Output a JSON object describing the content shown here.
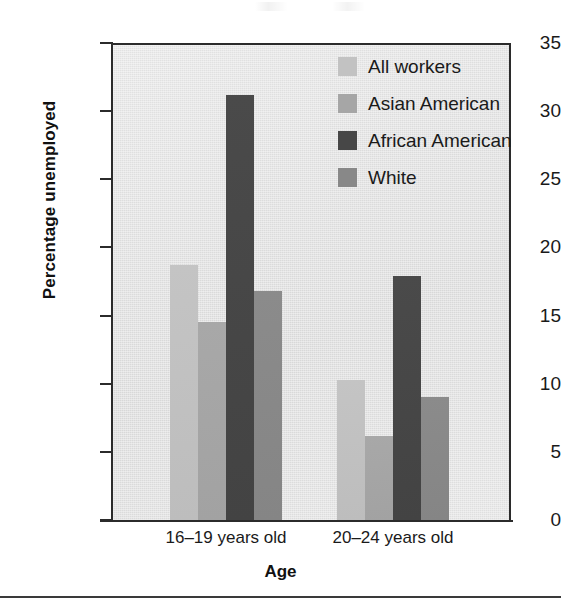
{
  "chart_data": {
    "type": "bar",
    "title": "",
    "xlabel": "Age",
    "ylabel": "Percentage unemployed",
    "categories": [
      "16–19 years old",
      "20–24 years old"
    ],
    "series": [
      {
        "name": "All workers",
        "color": "#c2c2c2",
        "values": [
          18.7,
          10.3
        ]
      },
      {
        "name": "Asian American",
        "color": "#a6a6a6",
        "values": [
          14.5,
          6.2
        ]
      },
      {
        "name": "African American",
        "color": "#474747",
        "values": [
          31.2,
          17.9
        ]
      },
      {
        "name": "White",
        "color": "#888888",
        "values": [
          16.8,
          9.0
        ]
      }
    ],
    "ylim": [
      0,
      35
    ],
    "yticks": [
      0,
      5,
      10,
      15,
      20,
      25,
      30,
      35
    ],
    "ytick_labels": [
      "0",
      "5",
      "10",
      "15",
      "20",
      "25",
      "30",
      "35"
    ],
    "grid": false,
    "legend_position": "top-right",
    "plot_background": "#e4e4e4",
    "axis_color": "#2b2b2b"
  }
}
